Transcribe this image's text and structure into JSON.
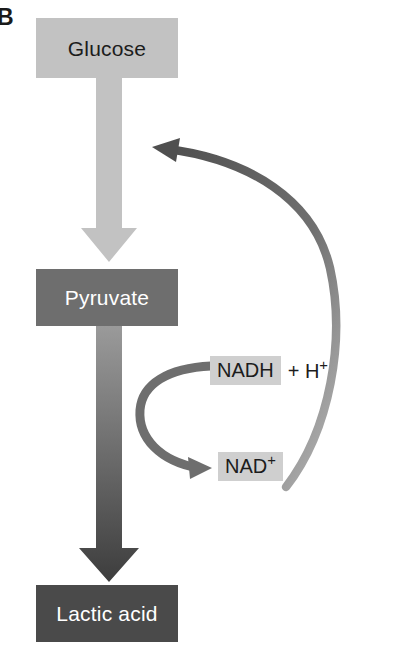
{
  "figure": {
    "panel_label": "B"
  },
  "nodes": [
    {
      "id": "glucose",
      "label": "Glucose",
      "fill": "#c2c2c2",
      "text_color": "#1c1c1c"
    },
    {
      "id": "pyruvate",
      "label": "Pyruvate",
      "fill": "#6e6e6e",
      "text_color": "#ffffff"
    },
    {
      "id": "lactic_acid",
      "label": "Lactic acid",
      "fill": "#4a4a4a",
      "text_color": "#ffffff"
    }
  ],
  "cofactors": [
    {
      "id": "nadh",
      "chip": "NADH",
      "tail": "+ H",
      "tail_superscript": "+",
      "chip_fill": "#cfcfcf"
    },
    {
      "id": "nad_plus",
      "chip": "NAD",
      "chip_superscript": "+",
      "chip_fill": "#cfcfcf"
    }
  ],
  "arrows": [
    {
      "id": "glucose-to-pyruvate",
      "type": "block-arrow",
      "direction": "down",
      "color": "#c2c2c2"
    },
    {
      "id": "pyruvate-to-lactic-acid",
      "type": "block-arrow",
      "direction": "down",
      "color_top": "#8c8c8c",
      "color_bottom": "#3f3f3f"
    },
    {
      "id": "nadh-to-nad-plus",
      "type": "curved-arrow",
      "direction": "right",
      "color": "#6e6e6e"
    },
    {
      "id": "nad-plus-recycle-to-glucose-step",
      "type": "curved-arrow",
      "direction": "up-left",
      "color": "#5a5a5a"
    }
  ],
  "colors": {
    "background": "#ffffff",
    "light_gray": "#c2c2c2",
    "mid_gray": "#6e6e6e",
    "dark_gray": "#4a4a4a",
    "chip_gray": "#cfcfcf",
    "text_dark": "#1c1c1c",
    "text_light": "#ffffff"
  }
}
